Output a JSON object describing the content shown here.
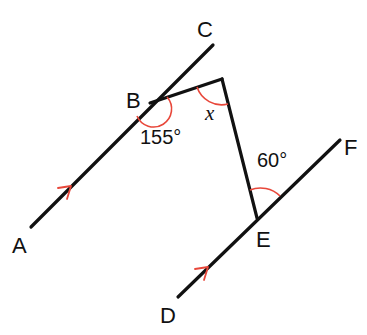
{
  "diagram": {
    "type": "geometry-parallel-lines-angles",
    "colors": {
      "line": "#111111",
      "marks": "#e8473a"
    },
    "points": [
      {
        "name": "A",
        "label": "A"
      },
      {
        "name": "B",
        "label": "B"
      },
      {
        "name": "C",
        "label": "C"
      },
      {
        "name": "D",
        "label": "D"
      },
      {
        "name": "E",
        "label": "E"
      },
      {
        "name": "F",
        "label": "F"
      }
    ],
    "lines": [
      {
        "name": "line-ABC",
        "from": "A",
        "to": "C",
        "parallel_mark": true
      },
      {
        "name": "line-DEF",
        "from": "D",
        "to": "F",
        "parallel_mark": true
      }
    ],
    "angles": {
      "at_B": "155°",
      "at_E": "60°",
      "unknown": "x"
    }
  }
}
